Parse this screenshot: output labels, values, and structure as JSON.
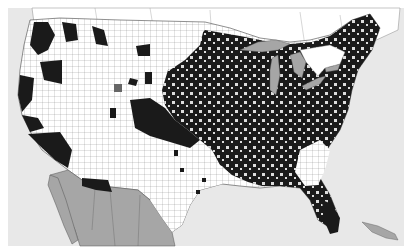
{
  "map": {
    "type": "choropleth",
    "region": "Contiguous United States counties",
    "fill_scheme": "binary",
    "colors": {
      "ocean": "#e8e8e8",
      "land_unfilled": "#ffffff",
      "county_filled": "#1a1a1a",
      "foreign_land": "#a6a6a6",
      "lakes": "#a6a6a6",
      "borders": "#555555",
      "frame": "#ffffff"
    },
    "dimensions": {
      "width": 412,
      "height": 252
    },
    "labels": []
  }
}
